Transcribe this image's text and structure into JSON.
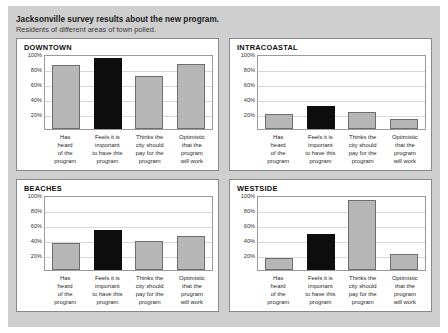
{
  "header": {
    "title": "Jacksonville survey results about the new program.",
    "subtitle": "Residents of different areas of town polled."
  },
  "style": {
    "backdrop_color": "#cfcfcf",
    "panel_background": "#ffffff",
    "panel_border": "#8a8a8a",
    "bar_color": "#b7b7b7",
    "bar_border_color": "#6e6e6e",
    "highlight_bar_color": "#0d0d0d",
    "gridline_color": "#d8d8d8"
  },
  "chart_data": [
    {
      "type": "bar",
      "title": "DOWNTOWN",
      "categories": [
        "Has heard of the program",
        "Feels it is important to have this program",
        "Thinks the city should pay for the program",
        "Optimistic that the program will work"
      ],
      "category_lines": [
        [
          "Has",
          "heard",
          "of the",
          "program"
        ],
        [
          "Feels it is",
          "important",
          "to have this",
          "program"
        ],
        [
          "Thinks the",
          "city should",
          "pay for the",
          "program"
        ],
        [
          "Optimistic",
          "that the",
          "program",
          "will work"
        ]
      ],
      "values": [
        86,
        95,
        71,
        87
      ],
      "highlight_index": 1,
      "xlabel": "",
      "ylabel": "",
      "ylim": [
        0,
        100
      ],
      "yticks": [
        100,
        80,
        60,
        40,
        20
      ],
      "ytick_labels": [
        "100%",
        "80%",
        "60%",
        "40%",
        "20%"
      ],
      "grid": true,
      "legend": "none"
    },
    {
      "type": "bar",
      "title": "INTRACOASTAL",
      "categories": [
        "Has heard of the program",
        "Feels it is important to have this program",
        "Thinks the city should pay for the program",
        "Optimistic that the program will work"
      ],
      "category_lines": [
        [
          "Has",
          "heard",
          "of the",
          "program"
        ],
        [
          "Feels it is",
          "important",
          "to have this",
          "program"
        ],
        [
          "Thinks the",
          "city should",
          "pay for the",
          "program"
        ],
        [
          "Optimistic",
          "that the",
          "program",
          "will work"
        ]
      ],
      "values": [
        20,
        31,
        23,
        13
      ],
      "highlight_index": 1,
      "xlabel": "",
      "ylabel": "",
      "ylim": [
        0,
        100
      ],
      "yticks": [
        100,
        80,
        60,
        40,
        20
      ],
      "ytick_labels": [
        "100%",
        "80%",
        "60%",
        "40%",
        "20%"
      ],
      "grid": true,
      "legend": "none"
    },
    {
      "type": "bar",
      "title": "BEACHES",
      "categories": [
        "Has heard of the program",
        "Feels it is important to have this program",
        "Thinks the city should pay for the program",
        "Optimistic that the program will work"
      ],
      "category_lines": [
        [
          "Has",
          "heard",
          "of the",
          "program"
        ],
        [
          "Feels it is",
          "important",
          "to have this",
          "program"
        ],
        [
          "Thinks the",
          "city should",
          "pay for the",
          "program"
        ],
        [
          "Optimistic",
          "that the",
          "program",
          "will work"
        ]
      ],
      "values": [
        36,
        54,
        39,
        45
      ],
      "highlight_index": 1,
      "xlabel": "",
      "ylabel": "",
      "ylim": [
        0,
        100
      ],
      "yticks": [
        100,
        80,
        60,
        40,
        20
      ],
      "ytick_labels": [
        "100%",
        "80%",
        "60%",
        "40%",
        "20%"
      ],
      "grid": true,
      "legend": "none"
    },
    {
      "type": "bar",
      "title": "WESTSIDE",
      "categories": [
        "Has heard of the program",
        "Feels it is important to have this program",
        "Thinks the city should pay for the program",
        "Optimistic that the program will work"
      ],
      "category_lines": [
        [
          "Has",
          "heard",
          "of the",
          "program"
        ],
        [
          "Feels it is",
          "important",
          "to have this",
          "program"
        ],
        [
          "Thinks the",
          "city should",
          "pay for the",
          "program"
        ],
        [
          "Optimistic",
          "that the",
          "program",
          "will work"
        ]
      ],
      "values": [
        16,
        48,
        93,
        22
      ],
      "highlight_index": 1,
      "xlabel": "",
      "ylabel": "",
      "ylim": [
        0,
        100
      ],
      "yticks": [
        100,
        80,
        60,
        40,
        20
      ],
      "ytick_labels": [
        "100%",
        "80%",
        "60%",
        "40%",
        "20%"
      ],
      "grid": true,
      "legend": "none"
    }
  ]
}
